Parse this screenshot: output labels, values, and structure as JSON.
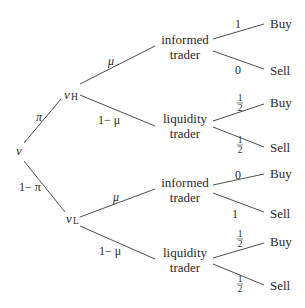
{
  "diagram": {
    "type": "probability-tree",
    "root": {
      "label": "v"
    },
    "states": [
      {
        "label": "v",
        "subscript": "H",
        "prob_from_root": "π"
      },
      {
        "label": "v",
        "subscript": "L",
        "prob_from_root": "1− π"
      }
    ],
    "trader_labels": {
      "informed_line1": "informed",
      "informed_line2": "trader",
      "liquidity_line1": "liquidity",
      "liquidity_line2": "trader"
    },
    "trader_probs": {
      "informed": "μ",
      "liquidity": "1− μ"
    },
    "leaves": {
      "buy": "Buy",
      "sell": "Sell"
    },
    "branch_probs": {
      "high_informed_buy": "1",
      "high_informed_sell": "0",
      "high_liquidity_buy_num": "1",
      "high_liquidity_buy_den": "2",
      "high_liquidity_sell_num": "1",
      "high_liquidity_sell_den": "2",
      "low_informed_buy": "0",
      "low_informed_sell": "1",
      "low_liquidity_buy_num": "1",
      "low_liquidity_buy_den": "2",
      "low_liquidity_sell_num": "1",
      "low_liquidity_sell_den": "2"
    }
  }
}
